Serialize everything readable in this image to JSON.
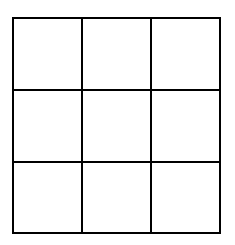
{
  "diagram": {
    "type": "grid",
    "rows": 3,
    "columns": 3,
    "line_color": "#000000",
    "background": "#ffffff",
    "x_lines": [
      13,
      82,
      151,
      220
    ],
    "y_lines": [
      18,
      90,
      162,
      233
    ],
    "cells": [
      [
        "",
        "",
        ""
      ],
      [
        "",
        "",
        ""
      ],
      [
        "",
        "",
        ""
      ]
    ]
  }
}
